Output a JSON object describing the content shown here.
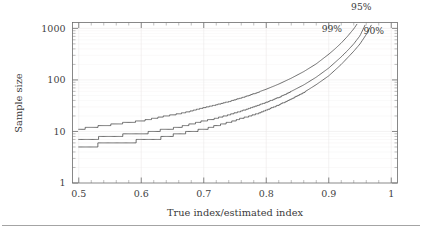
{
  "chart_data": {
    "type": "line",
    "title": "",
    "xlabel": "True index/estimated index",
    "ylabel": "Sample size",
    "xlim": [
      0.49,
      1.01
    ],
    "ylim": [
      1,
      1300
    ],
    "yscale": "log",
    "xscale": "linear",
    "grid": true,
    "legend_position": "inline-right",
    "x_ticks": [
      "0.5",
      "0.6",
      "0.7",
      "0.8",
      "0.9",
      "1"
    ],
    "x_tick_values": [
      0.5,
      0.6,
      0.7,
      0.8,
      0.9,
      1.0
    ],
    "y_ticks": [
      "1",
      "10",
      "100",
      "1000"
    ],
    "y_tick_values": [
      1,
      10,
      100,
      1000
    ],
    "annotations": [
      {
        "text": "95%",
        "x": 0.952,
        "y": 1900
      },
      {
        "text": "99%",
        "x": 0.905,
        "y": 860
      },
      {
        "text": "90%",
        "x": 0.972,
        "y": 780
      }
    ],
    "series": [
      {
        "name": "99%",
        "label": "99%",
        "color": "#555555",
        "x": [
          0.5,
          0.52,
          0.54,
          0.56,
          0.58,
          0.6,
          0.62,
          0.64,
          0.66,
          0.68,
          0.7,
          0.72,
          0.74,
          0.76,
          0.78,
          0.8,
          0.82,
          0.84,
          0.86,
          0.88,
          0.9,
          0.91,
          0.92,
          0.93,
          0.94,
          0.945
        ],
        "values": [
          11,
          12,
          13,
          14,
          15,
          16,
          18,
          20,
          22,
          25,
          29,
          33,
          38,
          45,
          54,
          66,
          83,
          108,
          145,
          205,
          315,
          400,
          520,
          700,
          980,
          1200
        ]
      },
      {
        "name": "95%",
        "label": "95%",
        "color": "#555555",
        "x": [
          0.5,
          0.52,
          0.54,
          0.56,
          0.58,
          0.6,
          0.62,
          0.64,
          0.66,
          0.68,
          0.7,
          0.72,
          0.74,
          0.76,
          0.78,
          0.8,
          0.82,
          0.84,
          0.86,
          0.88,
          0.9,
          0.92,
          0.93,
          0.94,
          0.95,
          0.958
        ],
        "values": [
          7,
          7,
          8,
          8,
          9,
          9,
          10,
          11,
          12,
          14,
          16,
          18,
          21,
          25,
          30,
          37,
          46,
          60,
          80,
          113,
          170,
          280,
          370,
          500,
          720,
          1150
        ]
      },
      {
        "name": "90%",
        "label": "90%",
        "color": "#555555",
        "x": [
          0.5,
          0.52,
          0.54,
          0.56,
          0.58,
          0.6,
          0.62,
          0.64,
          0.66,
          0.68,
          0.7,
          0.72,
          0.74,
          0.76,
          0.78,
          0.8,
          0.82,
          0.84,
          0.86,
          0.88,
          0.9,
          0.92,
          0.94,
          0.95,
          0.96,
          0.968
        ],
        "values": [
          5,
          5,
          6,
          6,
          6,
          7,
          7,
          8,
          9,
          10,
          11,
          13,
          15,
          18,
          21,
          26,
          33,
          43,
          57,
          81,
          120,
          200,
          360,
          500,
          760,
          1150
        ]
      }
    ]
  }
}
